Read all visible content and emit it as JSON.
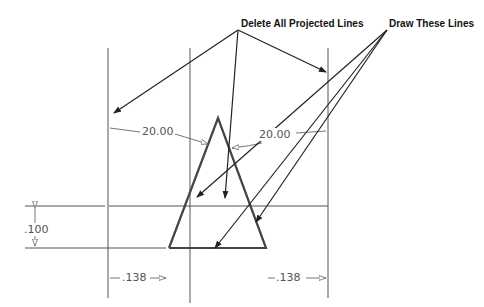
{
  "callouts": {
    "delete_label": "Delete All Projected Lines",
    "draw_label": "Draw These Lines"
  },
  "dimensions": {
    "angle_left": "20.00",
    "angle_right": "20.00",
    "height": ".100",
    "offset_left": ".138",
    "offset_right": ".138"
  },
  "colors": {
    "geometry": "#444444",
    "projected": "#555555",
    "dimension_text": "#555555"
  }
}
